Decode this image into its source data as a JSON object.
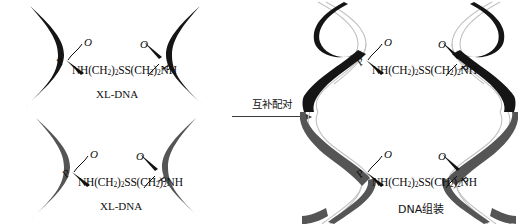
{
  "figure": {
    "background": "#ffffff",
    "colors": {
      "strand_dark": "#151515",
      "strand_gray": "#555555",
      "strand_light": "#c2c2c2",
      "text": "#111111",
      "arrow": "#3a3a3a"
    }
  },
  "chemistry": {
    "crosslinker_formula": "NH(CH",
    "crosslinker_sub_1": "2",
    "crosslinker_mid": ")",
    "crosslinker_sub_2": "2",
    "crosslinker_ss": "SS(CH",
    "crosslinker_sub_3": "2",
    "crosslinker_mid2": ")",
    "crosslinker_sub_4": "2",
    "crosslinker_end": "NH",
    "atom_phosphorus": "P",
    "atom_oxygen": "O"
  },
  "panels": {
    "top_left": {
      "name": "XL-DNA single strands (dark)",
      "caption": "XL-DNA",
      "strand_color": "#151515",
      "has_complement": false
    },
    "bottom_left": {
      "name": "XL-DNA single strands (gray)",
      "caption": "XL-DNA",
      "strand_color": "#555555",
      "has_complement": false
    },
    "top_right": {
      "name": "Assembled DNA duplex (dark)",
      "caption": "",
      "strand_color": "#151515",
      "has_complement": true
    },
    "bottom_right": {
      "name": "Assembled DNA duplex (gray)",
      "caption": "DNA组装",
      "strand_color": "#555555",
      "has_complement": true
    }
  },
  "arrow": {
    "label": "互补配对",
    "direction": "right"
  }
}
